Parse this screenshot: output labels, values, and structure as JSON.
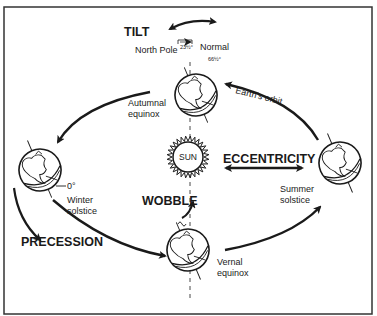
{
  "diagram": {
    "sun": {
      "label": "SUN"
    },
    "concepts": {
      "tilt": "TILT",
      "eccentricity": "ECCENTRICITY",
      "wobble": "WOBBLE",
      "precession": "PRECESSION"
    },
    "positions": {
      "autumnal": [
        "Autumnal",
        "equinox"
      ],
      "winter": [
        "Winter",
        "solstice"
      ],
      "summer": [
        "Summer",
        "solstice"
      ],
      "vernal": [
        "Vernal",
        "equinox"
      ]
    },
    "annotations": {
      "north_pole": "North Pole",
      "normal": "Normal",
      "tilt_angle": "23½°",
      "normal_angle": "66½°",
      "zero_deg": "0°",
      "orbit": "Earth's orbit"
    },
    "colors": {
      "ink": "#1a1a1a",
      "background": "#ffffff"
    }
  }
}
